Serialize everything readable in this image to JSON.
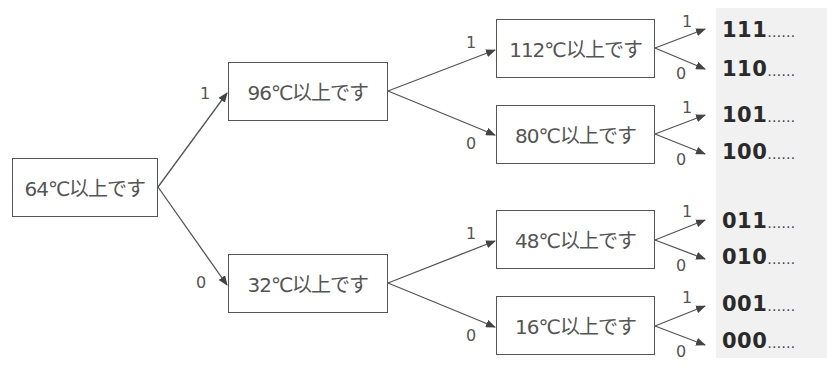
{
  "diagram": {
    "type": "binary-decision-tree",
    "unit": "℃",
    "root": {
      "id": "n64",
      "label": "64℃以上です"
    },
    "level1": [
      {
        "id": "n96",
        "label": "96℃以上です",
        "edge": "1"
      },
      {
        "id": "n32",
        "label": "32℃以上です",
        "edge": "0"
      }
    ],
    "level2": [
      {
        "id": "n112",
        "label": "112℃以上です",
        "parent": "n96",
        "edge": "1"
      },
      {
        "id": "n80",
        "label": "80℃以上です",
        "parent": "n96",
        "edge": "0"
      },
      {
        "id": "n48",
        "label": "48℃以上です",
        "parent": "n32",
        "edge": "1"
      },
      {
        "id": "n16",
        "label": "16℃以上です",
        "parent": "n32",
        "edge": "0"
      }
    ],
    "leaf_edges": [
      "1",
      "0",
      "1",
      "0",
      "1",
      "0",
      "1",
      "0"
    ],
    "codes": [
      {
        "bits": "111",
        "trail": "……"
      },
      {
        "bits": "110",
        "trail": "……"
      },
      {
        "bits": "101",
        "trail": "……"
      },
      {
        "bits": "100",
        "trail": "……"
      },
      {
        "bits": "011",
        "trail": "……"
      },
      {
        "bits": "010",
        "trail": "……"
      },
      {
        "bits": "001",
        "trail": "……"
      },
      {
        "bits": "000",
        "trail": "……"
      }
    ]
  },
  "colors": {
    "line": "#555555",
    "box_border": "#555555",
    "panel_bg": "#f1f1f1",
    "code_text": "#2a2a2a"
  }
}
